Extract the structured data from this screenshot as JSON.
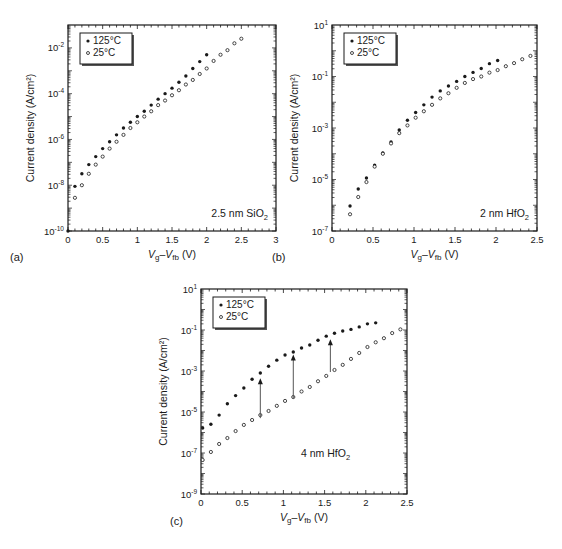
{
  "chart_data": [
    {
      "id": "a",
      "type": "scatter",
      "panel_label": "(a)",
      "title": "",
      "annotation": {
        "text": "2.5 nm SiO",
        "sub": "2"
      },
      "xlabel": {
        "main": "V",
        "sub1": "g",
        "sep": "–V",
        "sub2": "fb",
        "unit": " (V)"
      },
      "ylabel": "Current density (A/cm²)",
      "yscale": "log",
      "xlim": [
        0,
        3
      ],
      "ylim_log10": [
        -10,
        -1
      ],
      "xticks": [
        0,
        0.5,
        1,
        1.5,
        2,
        2.5,
        3
      ],
      "xtick_labels": [
        "0",
        "0.5",
        "1",
        "1.5",
        "2",
        "2.5",
        "3"
      ],
      "yticks_log10": [
        -10,
        -8,
        -6,
        -4,
        -2
      ],
      "ytick_labels": [
        "10",
        "10",
        "10",
        "10",
        "10"
      ],
      "ytick_exponents": [
        "-10",
        "-8",
        "-6",
        "-4",
        "-2"
      ],
      "legend": {
        "position": "upper-left",
        "entries": [
          "125°C",
          "25°C"
        ]
      },
      "series": [
        {
          "name": "125°C",
          "marker": "filled",
          "x": [
            0,
            0.1,
            0.2,
            0.3,
            0.4,
            0.5,
            0.6,
            0.7,
            0.8,
            0.9,
            1.0,
            1.1,
            1.2,
            1.3,
            1.4,
            1.5,
            1.6,
            1.7,
            1.8,
            1.9,
            2.0
          ],
          "log10_y": [
            -10.0,
            -8.05,
            -7.5,
            -7.1,
            -6.75,
            -6.4,
            -6.1,
            -5.8,
            -5.5,
            -5.25,
            -5.0,
            -4.77,
            -4.5,
            -4.24,
            -4.0,
            -3.76,
            -3.5,
            -3.23,
            -2.9,
            -2.6,
            -2.3
          ]
        },
        {
          "name": "25°C",
          "marker": "open",
          "x": [
            0.1,
            0.2,
            0.3,
            0.4,
            0.5,
            0.6,
            0.7,
            0.8,
            0.9,
            1.0,
            1.1,
            1.2,
            1.3,
            1.4,
            1.5,
            1.6,
            1.7,
            1.8,
            1.9,
            2.0,
            2.1,
            2.2,
            2.3,
            2.4,
            2.5
          ],
          "log10_y": [
            -8.55,
            -8.0,
            -7.5,
            -7.1,
            -6.75,
            -6.4,
            -6.1,
            -5.8,
            -5.5,
            -5.25,
            -5.0,
            -4.77,
            -4.5,
            -4.3,
            -4.07,
            -3.85,
            -3.6,
            -3.4,
            -3.14,
            -2.9,
            -2.57,
            -2.3,
            -2.1,
            -1.8,
            -1.6
          ]
        }
      ],
      "arrows": [],
      "box": {
        "left": 68,
        "top": 25,
        "right": 276,
        "bottom": 231
      }
    },
    {
      "id": "b",
      "type": "scatter",
      "panel_label": "(b)",
      "title": "",
      "annotation": {
        "text": "2 nm HfO",
        "sub": "2"
      },
      "xlabel": {
        "main": "V",
        "sub1": "g",
        "sep": "–V",
        "sub2": "fb",
        "unit": " (V)"
      },
      "ylabel": "Current density (A/cm²)",
      "yscale": "log",
      "xlim": [
        0,
        2.5
      ],
      "ylim_log10": [
        -7,
        1
      ],
      "xticks": [
        0,
        0.5,
        1,
        1.5,
        2,
        2.5
      ],
      "xtick_labels": [
        "0",
        "0.5",
        "1",
        "1.5",
        "2",
        "2.5"
      ],
      "yticks_log10": [
        -7,
        -5,
        -3,
        -1,
        1
      ],
      "ytick_labels": [
        "10",
        "10",
        "10",
        "10",
        "10"
      ],
      "ytick_exponents": [
        "-7",
        "-5",
        "-3",
        "-1",
        "1"
      ],
      "legend": {
        "position": "upper-left",
        "entries": [
          "125°C",
          "25°C"
        ]
      },
      "series": [
        {
          "name": "125°C",
          "marker": "filled",
          "x": [
            0.22,
            0.32,
            0.42,
            0.52,
            0.62,
            0.72,
            0.82,
            0.92,
            1.02,
            1.12,
            1.22,
            1.32,
            1.42,
            1.52,
            1.62,
            1.72,
            1.82,
            1.92,
            2.02
          ],
          "log10_y": [
            -6.03,
            -5.37,
            -4.94,
            -4.44,
            -3.97,
            -3.54,
            -3.08,
            -2.7,
            -2.4,
            -2.1,
            -1.8,
            -1.56,
            -1.37,
            -1.19,
            -1.0,
            -0.84,
            -0.69,
            -0.5,
            -0.38
          ]
        },
        {
          "name": "25°C",
          "marker": "open",
          "x": [
            0.22,
            0.32,
            0.42,
            0.52,
            0.62,
            0.72,
            0.82,
            0.92,
            1.02,
            1.12,
            1.22,
            1.32,
            1.42,
            1.52,
            1.62,
            1.72,
            1.82,
            1.92,
            2.02,
            2.12,
            2.22,
            2.32,
            2.42
          ],
          "log10_y": [
            -6.35,
            -5.68,
            -5.1,
            -4.5,
            -4.0,
            -3.6,
            -3.2,
            -2.9,
            -2.6,
            -2.35,
            -2.1,
            -1.85,
            -1.65,
            -1.44,
            -1.25,
            -1.1,
            -1.0,
            -0.85,
            -0.75,
            -0.6,
            -0.48,
            -0.33,
            -0.2
          ]
        }
      ],
      "arrows": [],
      "box": {
        "left": 332,
        "top": 25,
        "right": 537,
        "bottom": 231
      }
    },
    {
      "id": "c",
      "type": "scatter",
      "panel_label": "(c)",
      "title": "",
      "annotation": {
        "text": "4 nm HfO",
        "sub": "2"
      },
      "xlabel": {
        "main": "V",
        "sub1": "g",
        "sep": "–V",
        "sub2": "fb",
        "unit": " (V)"
      },
      "ylabel": "Current density (A/cm²)",
      "yscale": "log",
      "xlim": [
        0,
        2.5
      ],
      "ylim_log10": [
        -9,
        1
      ],
      "xticks": [
        0,
        0.5,
        1,
        1.5,
        2,
        2.5
      ],
      "xtick_labels": [
        "0",
        "0.5",
        "1",
        "1.5",
        "2",
        "2.5"
      ],
      "yticks_log10": [
        -9,
        -7,
        -5,
        -3,
        -1,
        1
      ],
      "ytick_labels": [
        "10",
        "10",
        "10",
        "10",
        "10",
        "10"
      ],
      "ytick_exponents": [
        "-9",
        "-7",
        "-5",
        "-3",
        "-1",
        "1"
      ],
      "legend": {
        "position": "upper-left",
        "entries": [
          "125°C",
          "25°C"
        ]
      },
      "series": [
        {
          "name": "125°C",
          "marker": "filled",
          "x": [
            0.02,
            0.12,
            0.22,
            0.32,
            0.42,
            0.52,
            0.62,
            0.72,
            0.82,
            0.92,
            1.02,
            1.12,
            1.22,
            1.32,
            1.42,
            1.52,
            1.62,
            1.72,
            1.82,
            1.92,
            2.02,
            2.12
          ],
          "log10_y": [
            -5.78,
            -5.6,
            -5.15,
            -4.6,
            -4.2,
            -3.83,
            -3.4,
            -3.1,
            -2.77,
            -2.47,
            -2.22,
            -2.07,
            -1.88,
            -1.73,
            -1.5,
            -1.3,
            -1.16,
            -1.05,
            -0.97,
            -0.85,
            -0.7,
            -0.65
          ]
        },
        {
          "name": "25°C",
          "marker": "open",
          "x": [
            0.02,
            0.12,
            0.22,
            0.32,
            0.42,
            0.52,
            0.62,
            0.72,
            0.82,
            0.92,
            1.02,
            1.12,
            1.22,
            1.32,
            1.42,
            1.52,
            1.62,
            1.72,
            1.82,
            1.92,
            2.02,
            2.12,
            2.22,
            2.32,
            2.42
          ],
          "log10_y": [
            -7.34,
            -6.95,
            -6.56,
            -6.27,
            -5.93,
            -5.63,
            -5.39,
            -5.15,
            -4.95,
            -4.7,
            -4.46,
            -4.27,
            -4.0,
            -3.78,
            -3.5,
            -3.24,
            -2.95,
            -2.7,
            -2.41,
            -2.12,
            -1.83,
            -1.6,
            -1.4,
            -1.15,
            -0.97
          ]
        }
      ],
      "arrows": [
        {
          "x": 0.72,
          "from_log10": -5.3,
          "to_log10": -3.35
        },
        {
          "x": 1.12,
          "from_log10": -4.35,
          "to_log10": -2.2
        },
        {
          "x": 1.57,
          "from_log10": -3.05,
          "to_log10": -1.45
        }
      ],
      "box": {
        "left": 201,
        "top": 289,
        "right": 407,
        "bottom": 494
      }
    }
  ]
}
